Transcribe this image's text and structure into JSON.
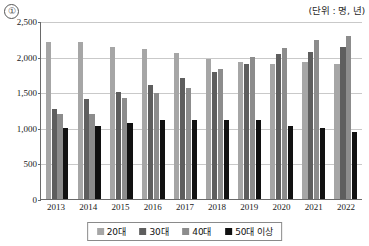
{
  "marker": {
    "label": "①"
  },
  "unit_note": "(단위 : 명, 년)",
  "legend": {
    "items": [
      {
        "label": "20대",
        "color": "#a6a6a6",
        "swatch_name": "legend-swatch-20s"
      },
      {
        "label": "30대",
        "color": "#5e5e5e",
        "swatch_name": "legend-swatch-30s"
      },
      {
        "label": "40대",
        "color": "#8c8c8c",
        "swatch_name": "legend-swatch-40s"
      },
      {
        "label": "50대 이상",
        "color": "#111111",
        "swatch_name": "legend-swatch-50s"
      }
    ]
  },
  "chart_data": {
    "type": "bar",
    "title": "",
    "subtitle": "",
    "xlabel": "",
    "ylabel": "",
    "unit": "(단위 : 명, 년)",
    "ylim": [
      0,
      2500
    ],
    "yticks": [
      0,
      500,
      1000,
      1500,
      2000,
      2500
    ],
    "ytick_labels": [
      "0",
      "500",
      "1,000",
      "1,500",
      "2,000",
      "2,500"
    ],
    "grid": true,
    "legend_position": "bottom",
    "categories": [
      "2013",
      "2014",
      "2015",
      "2016",
      "2017",
      "2018",
      "2019",
      "2020",
      "2021",
      "2022"
    ],
    "series": [
      {
        "name": "20대",
        "color": "#a6a6a6",
        "values": [
          2200,
          2210,
          2130,
          2100,
          2050,
          1960,
          1930,
          1890,
          1930,
          1900
        ]
      },
      {
        "name": "30대",
        "color": "#5e5e5e",
        "values": [
          1270,
          1400,
          1500,
          1600,
          1700,
          1780,
          1900,
          2030,
          2060,
          2140
        ]
      },
      {
        "name": "40대",
        "color": "#8c8c8c",
        "values": [
          1190,
          1200,
          1420,
          1490,
          1560,
          1820,
          2000,
          2120,
          2230,
          2290
        ]
      },
      {
        "name": "50대 이상",
        "color": "#111111",
        "values": [
          1000,
          1030,
          1070,
          1110,
          1110,
          1110,
          1110,
          1020,
          1000,
          940
        ]
      }
    ]
  }
}
